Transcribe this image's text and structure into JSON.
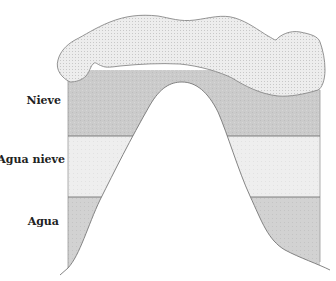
{
  "diagram": {
    "title": "",
    "zones": [
      {
        "id": "snow",
        "label": "Nieve",
        "color": "#c9c9c9"
      },
      {
        "id": "sleet",
        "label": "Agua nieve",
        "color": "#ececec"
      },
      {
        "id": "rain",
        "label": "Agua",
        "color": "#cfcfcf"
      }
    ],
    "cloud": {
      "label": "",
      "color": "#e8e8e8"
    },
    "mountain": {
      "color": "#ffffff"
    },
    "outline_color": "#777777"
  }
}
